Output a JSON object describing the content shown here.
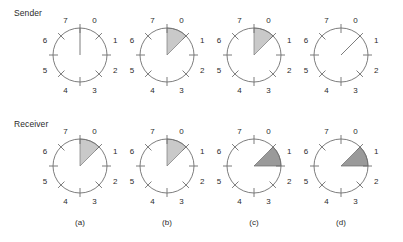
{
  "figure": {
    "title": "",
    "width": 403,
    "height": 242,
    "background": "#ffffff"
  },
  "rows": [
    {
      "key": "sender",
      "label": "Sender",
      "label_x": 14,
      "label_y": 8,
      "center_y": 55
    },
    {
      "key": "receiver",
      "label": "Receiver",
      "label_x": 14,
      "label_y": 119,
      "center_y": 166
    }
  ],
  "clock": {
    "sector_count": 8,
    "radius": 27,
    "tick_inner": 22,
    "tick_outer": 31,
    "label_radius": 38,
    "sector_labels": [
      "0",
      "1",
      "2",
      "3",
      "4",
      "5",
      "6",
      "7"
    ],
    "circle_color": "#6e6e6e",
    "tick_color": "#6e6e6e",
    "label_color": "#2b2b2b",
    "wedge_light_color": "#c9c9c9",
    "wedge_dark_color": "#9a9a9a"
  },
  "columns": [
    {
      "key": "a",
      "caption": "(a)",
      "center_x": 80,
      "caption_x": 80
    },
    {
      "key": "b",
      "caption": "(b)",
      "center_x": 167,
      "caption_x": 167
    },
    {
      "key": "c",
      "caption": "(c)",
      "center_x": 254,
      "caption_x": 254
    },
    {
      "key": "d",
      "caption": "(d)",
      "center_x": 341,
      "caption_x": 341
    }
  ],
  "caption_y": 218,
  "chart_data": {
    "type": "diagram",
    "sequence_numbers": [
      0,
      1,
      2,
      3,
      4,
      5,
      6,
      7
    ],
    "panels": [
      {
        "label": "(a)",
        "sender": {
          "window_start_sector": 0,
          "window_size_sectors": 0,
          "shaded": false,
          "shade": "none",
          "pointer_sector_boundary": 0
        },
        "receiver": {
          "window_start_sector": 0,
          "window_size_sectors": 1,
          "shaded": true,
          "shade": "light",
          "pointer_sector_boundary": null
        }
      },
      {
        "label": "(b)",
        "sender": {
          "window_start_sector": 0,
          "window_size_sectors": 1,
          "shaded": true,
          "shade": "light",
          "pointer_sector_boundary": null
        },
        "receiver": {
          "window_start_sector": 0,
          "window_size_sectors": 1,
          "shaded": true,
          "shade": "light",
          "pointer_sector_boundary": null
        }
      },
      {
        "label": "(c)",
        "sender": {
          "window_start_sector": 0,
          "window_size_sectors": 1,
          "shaded": true,
          "shade": "light",
          "pointer_sector_boundary": null
        },
        "receiver": {
          "window_start_sector": 1,
          "window_size_sectors": 1,
          "shaded": true,
          "shade": "dark",
          "pointer_sector_boundary": null
        }
      },
      {
        "label": "(d)",
        "sender": {
          "window_start_sector": 1,
          "window_size_sectors": 0,
          "shaded": false,
          "shade": "none",
          "pointer_sector_boundary": 1
        },
        "receiver": {
          "window_start_sector": 1,
          "window_size_sectors": 1,
          "shaded": true,
          "shade": "dark",
          "pointer_sector_boundary": null
        }
      }
    ]
  }
}
